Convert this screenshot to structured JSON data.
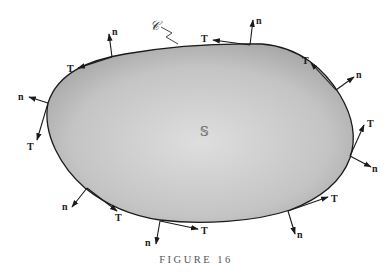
{
  "figure": {
    "caption": "FIGURE 16",
    "curve_label": "𝒞",
    "region_label": "𝕊",
    "fill_color_edge": "#a8a8a8",
    "fill_color_center": "#dcdcdc",
    "outline_color": "#1a1a1a",
    "vector_labels": {
      "normal": "n",
      "tangent": "T"
    },
    "vector_pairs": [
      {
        "id": 1,
        "location": "top-left",
        "n_label": "n",
        "t_label": "T"
      },
      {
        "id": 2,
        "location": "left",
        "n_label": "n",
        "t_label": "T"
      },
      {
        "id": 3,
        "location": "bottom-left",
        "n_label": "n",
        "t_label": "T"
      },
      {
        "id": 4,
        "location": "bottom",
        "n_label": "n",
        "t_label": "T"
      },
      {
        "id": 5,
        "location": "bottom-right",
        "n_label": "n",
        "t_label": "T"
      },
      {
        "id": 6,
        "location": "right",
        "n_label": "n",
        "t_label": "T"
      },
      {
        "id": 7,
        "location": "top-right",
        "n_label": "n",
        "t_label": "T"
      },
      {
        "id": 8,
        "location": "top",
        "n_label": "n",
        "t_label": "T"
      }
    ]
  }
}
